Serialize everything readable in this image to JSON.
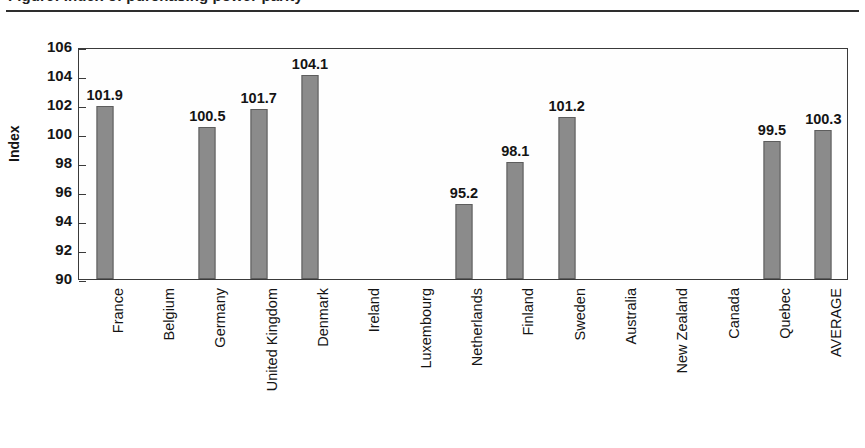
{
  "title": {
    "text": "Figure: Index of purchasing power parity",
    "rule": "horizontal-rule"
  },
  "chart_data": {
    "type": "bar",
    "title": "",
    "xlabel": "",
    "ylabel": "Index",
    "ylim": [
      90,
      106
    ],
    "ytick_step": 2,
    "yticks": [
      "106",
      "104",
      "102",
      "100",
      "98",
      "96",
      "94",
      "92",
      "90"
    ],
    "grid": false,
    "legend": false,
    "bar_color": "#8b8b8b",
    "bar_edge_color": "#5d5d5d",
    "categories": [
      "France",
      "Belgium",
      "Germany",
      "United Kingdom",
      "Denmark",
      "Ireland",
      "Luxembourg",
      "Netherlands",
      "Finland",
      "Sweden",
      "Australia",
      "New Zealand",
      "Canada",
      "Quebec",
      "AVERAGE"
    ],
    "values": [
      101.9,
      null,
      100.5,
      101.7,
      104.1,
      null,
      null,
      95.2,
      98.1,
      101.2,
      null,
      null,
      null,
      99.5,
      100.3
    ],
    "value_labels": [
      "101.9",
      "",
      "100.5",
      "101.7",
      "104.1",
      "",
      "",
      "95.2",
      "98.1",
      "101.2",
      "",
      "",
      "",
      "99.5",
      "100.3"
    ]
  }
}
